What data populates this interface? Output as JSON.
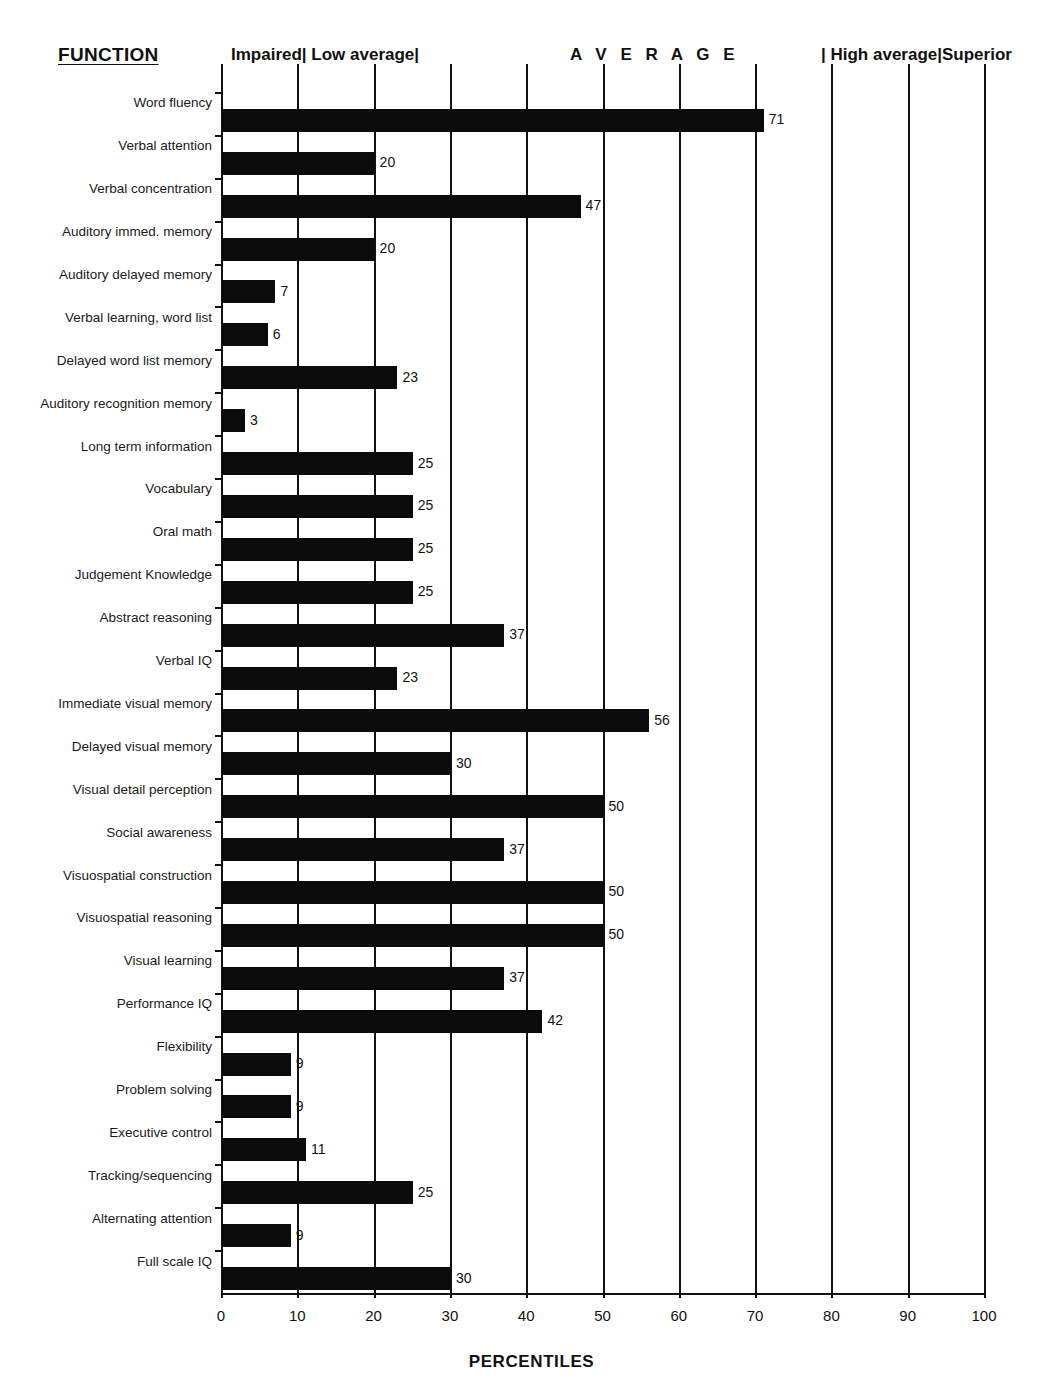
{
  "header": {
    "function_title": "FUNCTION",
    "bands": [
      {
        "label": "Impaired| Low average|",
        "name": "band-impaired-low-average"
      },
      {
        "label": "A V E R A G E",
        "name": "band-average"
      },
      {
        "label": "| High average|Superior",
        "name": "band-high-average-superior"
      }
    ]
  },
  "chart_data": {
    "type": "bar",
    "orientation": "horizontal",
    "title": "",
    "xlabel": "PERCENTILES",
    "ylabel": "FUNCTION",
    "xlim": [
      0,
      100
    ],
    "xticks": [
      0,
      10,
      20,
      30,
      40,
      50,
      60,
      70,
      80,
      90,
      100
    ],
    "grid": "vertical",
    "legend": "none",
    "bar_color": "#0b0b0b",
    "categories": [
      "Word fluency",
      "Verbal attention",
      "Verbal concentration",
      "Auditory immed. memory",
      "Auditory delayed memory",
      "Verbal learning, word list",
      "Delayed word list memory",
      "Auditory recognition memory",
      "Long term information",
      "Vocabulary",
      "Oral math",
      "Judgement Knowledge",
      "Abstract reasoning",
      "Verbal IQ",
      "Immediate visual memory",
      "Delayed visual memory",
      "Visual detail perception",
      "Social awareness",
      "Visuospatial construction",
      "Visuospatial reasoning",
      "Visual learning",
      "Performance IQ",
      "Flexibility",
      "Problem solving",
      "Executive control",
      "Tracking/sequencing",
      "Alternating attention",
      "Full scale IQ"
    ],
    "values": [
      71,
      20,
      47,
      20,
      7,
      6,
      23,
      3,
      25,
      25,
      25,
      25,
      37,
      23,
      56,
      30,
      50,
      37,
      50,
      50,
      37,
      42,
      9,
      9,
      11,
      25,
      9,
      30
    ],
    "value_labels": [
      "71",
      "20",
      "47",
      "20",
      "7",
      "6",
      "23",
      "3",
      "25",
      "25",
      "25",
      "25",
      "37",
      "23",
      "56",
      "30",
      "50",
      "37",
      "50",
      "50",
      "37",
      "42",
      "9",
      "9",
      "11",
      "25",
      "9",
      "30"
    ],
    "bands": [
      {
        "label": "Impaired",
        "range": [
          0,
          9
        ]
      },
      {
        "label": "Low average",
        "range": [
          9,
          25
        ]
      },
      {
        "label": "AVERAGE",
        "range": [
          25,
          75
        ]
      },
      {
        "label": "High average",
        "range": [
          75,
          91
        ]
      },
      {
        "label": "Superior",
        "range": [
          91,
          100
        ]
      }
    ]
  }
}
